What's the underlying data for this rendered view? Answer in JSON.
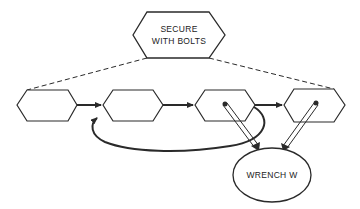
{
  "diagram": {
    "goal_node": {
      "line1": "SECURE",
      "line2": "WITH BOLTS"
    },
    "resource_node": {
      "label": "WRENCH W"
    },
    "step_nodes": [
      {
        "label": ""
      },
      {
        "label": ""
      },
      {
        "label": ""
      },
      {
        "label": ""
      }
    ],
    "colors": {
      "stroke": "#2a2a2a",
      "background": "#ffffff"
    }
  }
}
